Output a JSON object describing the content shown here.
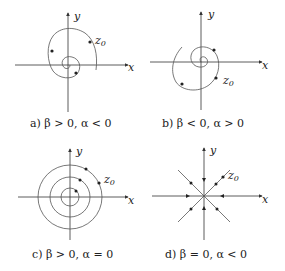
{
  "figure": {
    "panels": [
      {
        "id": "a",
        "caption": "a) β > 0, α < 0",
        "x_label": "x",
        "y_label": "y",
        "point_label": "z",
        "point_sub": "0",
        "behavior": "spiral inward (stable focus)"
      },
      {
        "id": "b",
        "caption": "b) β < 0, α > 0",
        "x_label": "x",
        "y_label": "y",
        "point_label": "z",
        "point_sub": "0",
        "behavior": "spiral outward (unstable focus)"
      },
      {
        "id": "c",
        "caption": "c) β > 0, α = 0",
        "x_label": "x",
        "y_label": "y",
        "point_label": "z",
        "point_sub": "0",
        "behavior": "concentric circles (center)"
      },
      {
        "id": "d",
        "caption": "d) β = 0, α < 0",
        "x_label": "x",
        "y_label": "y",
        "point_label": "z",
        "point_sub": "0",
        "behavior": "radial lines into origin (stable node)"
      }
    ]
  }
}
